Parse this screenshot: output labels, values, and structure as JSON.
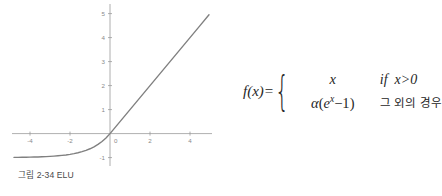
{
  "figure": {
    "caption": "그림 2-34 ELU"
  },
  "formula": {
    "lhs": "f(x)",
    "equals": "=",
    "brace": "{",
    "cases": [
      {
        "expr_plain": "x",
        "cond": "if  x>0",
        "cond_kind": "math"
      },
      {
        "expr_plain": "α(e^x−1)",
        "cond": "그 외의 경우",
        "cond_kind": "hangul"
      }
    ],
    "alpha": "α",
    "open_paren": "(",
    "base_e": "e",
    "exponent": "x",
    "minus_one": "−1",
    "close_paren": ")",
    "cond_if": "if",
    "cond_x_gt_0": "x>0",
    "cond_otherwise": "그 외의 경우"
  },
  "chart_data": {
    "type": "line",
    "title": "",
    "xlabel": "",
    "ylabel": "",
    "xlim": [
      -4.9,
      5.1
    ],
    "ylim": [
      -1.35,
      5.4
    ],
    "xticks": [
      -4,
      -2,
      0,
      2,
      4
    ],
    "xtick_labels": [
      "-4",
      "-2",
      "0",
      "2",
      "4"
    ],
    "yticks": [
      -1,
      1,
      2,
      3,
      4,
      5
    ],
    "ytick_labels": [
      "-1",
      "1",
      "2",
      "3",
      "4",
      "5"
    ],
    "grid": false,
    "legend": null,
    "series": [
      {
        "name": "ELU",
        "alpha": 1.0,
        "color": "#808080",
        "linewidth": 1.4,
        "x": [
          -4.8,
          -4.6,
          -4.4,
          -4.2,
          -4.0,
          -3.8,
          -3.6,
          -3.4,
          -3.2,
          -3.0,
          -2.8,
          -2.6,
          -2.4,
          -2.2,
          -2.0,
          -1.8,
          -1.6,
          -1.4,
          -1.2,
          -1.0,
          -0.8,
          -0.6,
          -0.4,
          -0.2,
          0.0,
          0.5,
          1.0,
          1.5,
          2.0,
          2.5,
          3.0,
          3.5,
          4.0,
          4.5,
          4.95
        ],
        "y": [
          -0.9918,
          -0.9899,
          -0.9877,
          -0.985,
          -0.9817,
          -0.9776,
          -0.9727,
          -0.9666,
          -0.9592,
          -0.9502,
          -0.9392,
          -0.9257,
          -0.9093,
          -0.8892,
          -0.8647,
          -0.8347,
          -0.7981,
          -0.7534,
          -0.6988,
          -0.6321,
          -0.5507,
          -0.4512,
          -0.3297,
          -0.1813,
          0.0,
          0.5,
          1.0,
          1.5,
          2.0,
          2.5,
          3.0,
          3.5,
          4.0,
          4.5,
          4.95
        ]
      }
    ],
    "axis_color": "#9a9a9a",
    "tick_label_color": "#8a8a8a"
  },
  "colors": {
    "curve": "#808080",
    "axis": "#9a9a9a",
    "caption": "#4a4a4a",
    "formula": "#262626",
    "background": "#ffffff"
  }
}
